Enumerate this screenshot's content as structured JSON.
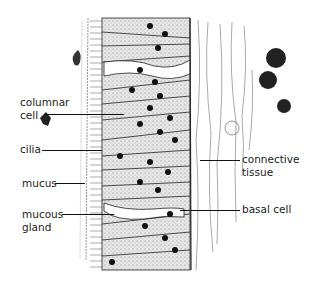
{
  "diagram": {
    "type": "histology illustration",
    "labels_left": [
      {
        "id": "columnar-cell",
        "line1": "columnar",
        "line2": "cell"
      },
      {
        "id": "cilia",
        "line1": "cilia"
      },
      {
        "id": "mucus",
        "line1": "mucus"
      },
      {
        "id": "mucous-gland",
        "line1": "mucous",
        "line2": "gland"
      }
    ],
    "labels_right": [
      {
        "id": "connective-tissue",
        "line1": "connective",
        "line2": "tissue"
      },
      {
        "id": "basal-cell",
        "line1": "basal cell"
      }
    ],
    "colors": {
      "ink": "#111111",
      "background": "#ffffff",
      "cell_fill": "#cfcfcf"
    }
  }
}
